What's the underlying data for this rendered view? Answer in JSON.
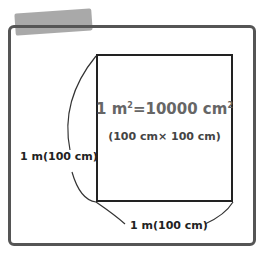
{
  "diagram": {
    "equation": {
      "lhs": "1 m",
      "lhs_exp": "2",
      "eq": "=10000 cm",
      "rhs_exp": "2"
    },
    "sub_equation": "(100 cm× 100 cm)",
    "left_label": "1 m(100 cm)",
    "bottom_label": "1 m(100 cm)",
    "colors": {
      "frame": "#555555",
      "square": "#222222",
      "tape": "#9a9a9a",
      "main_text": "#666666"
    }
  }
}
